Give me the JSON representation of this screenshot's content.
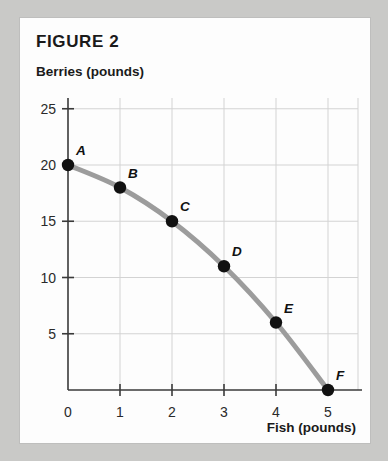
{
  "figure": {
    "title": "FIGURE 2"
  },
  "chart_data": {
    "type": "line",
    "title": "FIGURE 2",
    "xlabel": "Fish (pounds)",
    "ylabel": "Berries (pounds)",
    "xlim": [
      0,
      5.6
    ],
    "ylim": [
      0,
      27
    ],
    "grid": true,
    "legend": null,
    "curve_color": "#9c9c9c",
    "point_color": "#111111",
    "xticks": [
      "0",
      "1",
      "2",
      "3",
      "4",
      "5"
    ],
    "xtick_values": [
      0,
      1,
      2,
      3,
      4,
      5
    ],
    "yticks": [
      "5",
      "10",
      "15",
      "20",
      "25"
    ],
    "ytick_values": [
      5,
      10,
      15,
      20,
      25
    ],
    "x": [
      0,
      1,
      2,
      3,
      4,
      5
    ],
    "values": [
      20,
      18,
      15,
      11,
      6,
      0
    ],
    "point_labels": [
      "A",
      "B",
      "C",
      "D",
      "E",
      "F"
    ],
    "points": [
      {
        "label": "A",
        "x": 0,
        "y": 20
      },
      {
        "label": "B",
        "x": 1,
        "y": 18
      },
      {
        "label": "C",
        "x": 2,
        "y": 15
      },
      {
        "label": "D",
        "x": 3,
        "y": 11
      },
      {
        "label": "E",
        "x": 4,
        "y": 6
      },
      {
        "label": "F",
        "x": 5,
        "y": 0
      }
    ]
  }
}
